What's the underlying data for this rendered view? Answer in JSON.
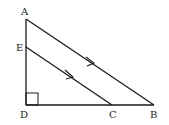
{
  "diagram": {
    "type": "geometry",
    "points": {
      "A": {
        "label": "A",
        "x": 26,
        "y": 19
      },
      "E": {
        "label": "E",
        "x": 26,
        "y": 47
      },
      "D": {
        "label": "D",
        "x": 26,
        "y": 105
      },
      "C": {
        "label": "C",
        "x": 112,
        "y": 105
      },
      "B": {
        "label": "B",
        "x": 154,
        "y": 105
      }
    },
    "segments": [
      "AD",
      "DB",
      "AB",
      "EC"
    ],
    "parallel_marks": [
      "AB",
      "EC"
    ],
    "right_angle": "D",
    "colors": {
      "line": "#1a1a1a",
      "background": "#ffffff"
    }
  }
}
